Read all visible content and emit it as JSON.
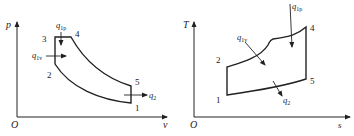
{
  "diagrams": [
    {
      "id": "pv",
      "y_axis_label": "p",
      "x_axis_label": "v",
      "origin_label": "O",
      "points": [
        {
          "label": "1"
        },
        {
          "label": "2"
        },
        {
          "label": "3"
        },
        {
          "label": "4"
        },
        {
          "label": "5"
        }
      ],
      "heat_labels": {
        "q1p": {
          "q": "q",
          "sub": "1p"
        },
        "q1v": {
          "q": "q",
          "sub": "1v"
        },
        "q2": {
          "q": "q",
          "sub": "2"
        }
      }
    },
    {
      "id": "ts",
      "y_axis_label": "T",
      "x_axis_label": "s",
      "origin_label": "O",
      "points": [
        {
          "label": "1"
        },
        {
          "label": "2"
        },
        {
          "label": "4"
        },
        {
          "label": "5"
        }
      ],
      "heat_labels": {
        "q1p": {
          "q": "q",
          "sub": "1p"
        },
        "q1v": {
          "q": "q",
          "sub": "1v"
        },
        "q2": {
          "q": "q",
          "sub": "2"
        }
      }
    }
  ],
  "colors": {
    "line": "#222222",
    "background": "#ffffff"
  }
}
